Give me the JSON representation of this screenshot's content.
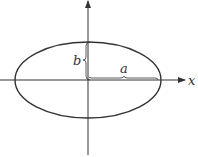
{
  "diagram": {
    "type": "ellipse-with-axes",
    "colors": {
      "stroke": "#333333",
      "background": "#ffffff"
    },
    "center": {
      "x": 88,
      "y": 80
    },
    "ellipse": {
      "rx": 73,
      "ry": 38
    },
    "labels": {
      "x_axis": "x",
      "semi_major": "a",
      "semi_minor": "b"
    }
  }
}
